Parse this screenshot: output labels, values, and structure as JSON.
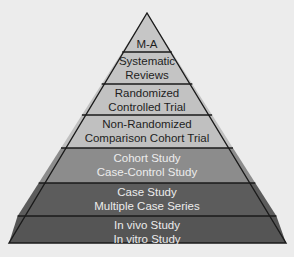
{
  "diagram": {
    "type": "pyramid",
    "levels": [
      {
        "lines": [
          "M-A"
        ],
        "fill": "#c6c6c6",
        "text_color": "#1e1e1e"
      },
      {
        "lines": [
          "Systematic",
          "Reviews"
        ],
        "fill": "#c4c4c4",
        "text_color": "#1e1e1e"
      },
      {
        "lines": [
          "Randomized",
          "Controlled Trial"
        ],
        "fill": "#c2c2c2",
        "text_color": "#1e1e1e"
      },
      {
        "lines": [
          "Non-Randomized",
          "Comparison Cohort Trial"
        ],
        "fill": "#c0c0c0",
        "text_color": "#1e1e1e"
      },
      {
        "lines": [
          "Cohort Study",
          "Case-Control Study"
        ],
        "fill": "#8c8c8c",
        "text_color": "#ececec"
      },
      {
        "lines": [
          "Case Study",
          "Multiple Case Series"
        ],
        "fill": "#5c5c5c",
        "text_color": "#ececec"
      },
      {
        "lines": [
          "In vivo Study",
          "In vitro Study"
        ],
        "fill": "#555555",
        "text_color": "#ececec"
      }
    ]
  }
}
